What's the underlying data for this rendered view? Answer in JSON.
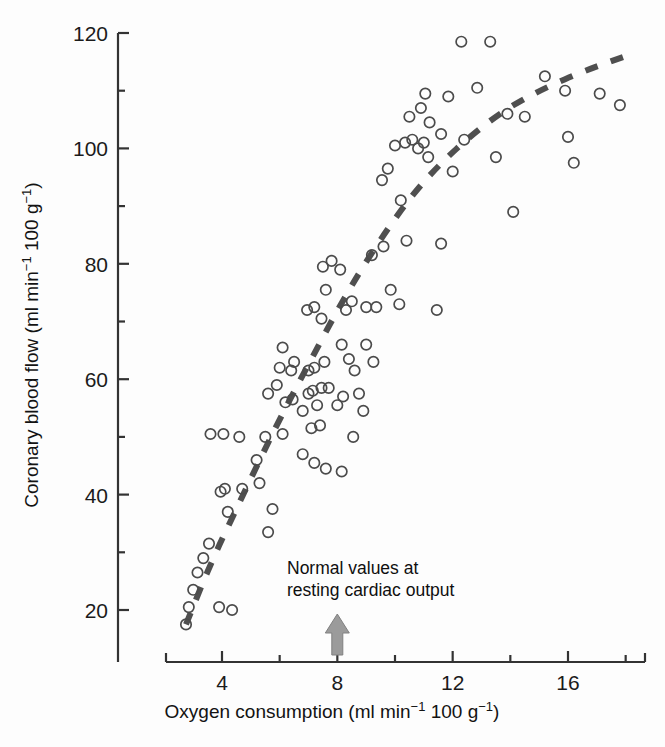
{
  "chart_data": {
    "type": "scatter",
    "title": "",
    "xlabel": "Oxygen consumption (ml min⁻¹ 100 g⁻¹)",
    "ylabel": "Coronary blood flow (ml min⁻¹ 100 g⁻¹)",
    "xlabel_parts": {
      "a": "Oxygen consumption (ml min",
      "sup1": "−1",
      "b": " 100 g",
      "sup2": "−1",
      "c": ")"
    },
    "ylabel_parts": {
      "a": "Coronary blood flow (ml min",
      "sup1": "−1",
      "b": " 100 g",
      "sup2": "−1",
      "c": ")"
    },
    "xlim": [
      2.2,
      18.2
    ],
    "ylim": [
      12,
      122
    ],
    "xticks": [
      4,
      8,
      12,
      16
    ],
    "xtick_labels": [
      "4",
      "8",
      "12",
      "16"
    ],
    "x_minor_ticks": [
      6,
      10,
      14,
      18
    ],
    "yticks": [
      20,
      40,
      60,
      80,
      100,
      120
    ],
    "ytick_labels": [
      "20",
      "40",
      "60",
      "80",
      "100",
      "120"
    ],
    "y_minor_ticks": [
      30,
      50,
      70,
      90,
      110
    ],
    "grid": false,
    "legend": null,
    "marker": "open-circle",
    "marker_color": "#4b4b4b",
    "points": [
      [
        2.75,
        17.5
      ],
      [
        2.85,
        20.5
      ],
      [
        3.0,
        23.5
      ],
      [
        3.15,
        26.5
      ],
      [
        3.35,
        29.0
      ],
      [
        3.55,
        31.5
      ],
      [
        3.9,
        20.5
      ],
      [
        4.35,
        20.0
      ],
      [
        3.95,
        40.5
      ],
      [
        4.1,
        41.0
      ],
      [
        4.2,
        37.0
      ],
      [
        3.6,
        50.5
      ],
      [
        4.05,
        50.5
      ],
      [
        4.6,
        50.0
      ],
      [
        4.7,
        41.0
      ],
      [
        5.2,
        46.0
      ],
      [
        5.3,
        42.0
      ],
      [
        5.6,
        33.5
      ],
      [
        5.75,
        37.5
      ],
      [
        5.5,
        50.0
      ],
      [
        6.1,
        50.5
      ],
      [
        5.6,
        57.5
      ],
      [
        5.9,
        59.0
      ],
      [
        6.0,
        62.0
      ],
      [
        6.1,
        65.5
      ],
      [
        6.4,
        61.5
      ],
      [
        6.5,
        63.0
      ],
      [
        6.2,
        56.0
      ],
      [
        6.45,
        56.5
      ],
      [
        6.8,
        54.5
      ],
      [
        7.0,
        57.5
      ],
      [
        7.15,
        58.0
      ],
      [
        7.3,
        55.5
      ],
      [
        7.45,
        58.5
      ],
      [
        7.0,
        61.5
      ],
      [
        7.2,
        62.0
      ],
      [
        7.55,
        63.0
      ],
      [
        7.7,
        58.5
      ],
      [
        7.4,
        52.0
      ],
      [
        7.1,
        51.5
      ],
      [
        6.8,
        47.0
      ],
      [
        7.2,
        45.5
      ],
      [
        7.6,
        44.5
      ],
      [
        6.95,
        72.0
      ],
      [
        7.2,
        72.5
      ],
      [
        7.45,
        70.5
      ],
      [
        7.6,
        75.5
      ],
      [
        7.5,
        79.5
      ],
      [
        7.8,
        80.5
      ],
      [
        8.1,
        79.0
      ],
      [
        8.3,
        72.0
      ],
      [
        8.5,
        73.5
      ],
      [
        8.15,
        66.0
      ],
      [
        8.4,
        63.5
      ],
      [
        8.6,
        61.5
      ],
      [
        8.75,
        57.5
      ],
      [
        8.9,
        54.5
      ],
      [
        8.2,
        57.0
      ],
      [
        8.0,
        55.5
      ],
      [
        8.55,
        50.0
      ],
      [
        8.15,
        44.0
      ],
      [
        9.0,
        66.0
      ],
      [
        9.25,
        63.0
      ],
      [
        9.0,
        72.5
      ],
      [
        9.35,
        72.5
      ],
      [
        9.2,
        81.5
      ],
      [
        9.6,
        83.0
      ],
      [
        9.55,
        94.5
      ],
      [
        10.2,
        91.0
      ],
      [
        10.0,
        100.5
      ],
      [
        9.75,
        96.5
      ],
      [
        10.35,
        101.0
      ],
      [
        10.6,
        101.5
      ],
      [
        10.8,
        100.0
      ],
      [
        11.0,
        101.0
      ],
      [
        11.15,
        98.5
      ],
      [
        10.5,
        105.5
      ],
      [
        10.9,
        107.0
      ],
      [
        11.2,
        104.5
      ],
      [
        11.6,
        102.5
      ],
      [
        11.05,
        109.5
      ],
      [
        10.4,
        84.0
      ],
      [
        11.6,
        83.5
      ],
      [
        11.45,
        72.0
      ],
      [
        12.3,
        118.5
      ],
      [
        13.3,
        118.5
      ],
      [
        12.85,
        110.5
      ],
      [
        13.9,
        106.0
      ],
      [
        14.5,
        105.5
      ],
      [
        13.5,
        98.5
      ],
      [
        14.1,
        89.0
      ],
      [
        15.9,
        110.0
      ],
      [
        17.1,
        109.5
      ],
      [
        15.2,
        112.5
      ],
      [
        17.8,
        107.5
      ],
      [
        16.2,
        97.5
      ],
      [
        16.0,
        102.0
      ],
      [
        9.85,
        75.5
      ],
      [
        10.15,
        73.0
      ],
      [
        12.0,
        96.0
      ],
      [
        12.4,
        101.5
      ],
      [
        11.85,
        109.0
      ]
    ],
    "trendline": {
      "style": "dashed",
      "color": "#4f4f4f",
      "description": "dashed curved regression line",
      "path": [
        [
          2.75,
          17.5
        ],
        [
          3.6,
          28.0
        ],
        [
          4.5,
          37.5
        ],
        [
          5.4,
          47.0
        ],
        [
          6.3,
          56.0
        ],
        [
          7.1,
          63.5
        ],
        [
          7.9,
          71.0
        ],
        [
          8.7,
          78.0
        ],
        [
          9.6,
          85.0
        ],
        [
          10.6,
          92.0
        ],
        [
          11.6,
          97.5
        ],
        [
          12.7,
          102.5
        ],
        [
          13.9,
          107.0
        ],
        [
          15.2,
          110.5
        ],
        [
          16.6,
          113.5
        ],
        [
          18.0,
          116.0
        ]
      ]
    },
    "annotation": {
      "line1": "Normal values at",
      "line2": "resting cardiac output",
      "arrow": {
        "name": "up-arrow-marker",
        "x_value": 8,
        "color": "#9b9b9b",
        "direction": "up"
      }
    }
  }
}
